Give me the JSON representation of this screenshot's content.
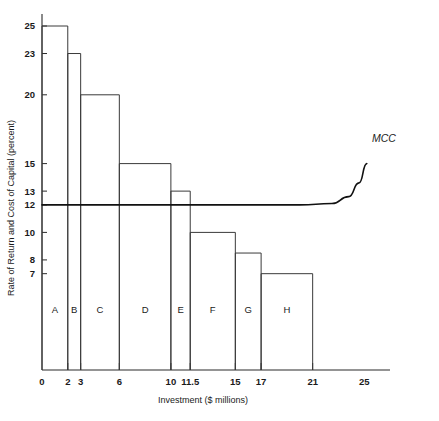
{
  "chart_data": {
    "type": "bar",
    "title": "",
    "subtitle": "",
    "xlabel": "Investment ($ millions)",
    "ylabel": "Rate of Return and Cost of Capital (percent)",
    "xlim": [
      0,
      27
    ],
    "ylim": [
      0,
      26
    ],
    "grid": false,
    "legend_position": "none",
    "x_tick_labels": [
      "0",
      "2",
      "3",
      "6",
      "10",
      "11.5",
      "15",
      "17",
      "21",
      "25"
    ],
    "x_tick_values": [
      0,
      2,
      3,
      6,
      10,
      11.5,
      15,
      17,
      21,
      25
    ],
    "y_tick_labels": [
      "25",
      "23",
      "20",
      "15",
      "13",
      "12",
      "10",
      "8",
      "7"
    ],
    "y_tick_values": [
      25,
      23,
      20,
      15,
      13,
      12,
      10,
      8,
      7
    ],
    "categories": [
      "A",
      "B",
      "C",
      "D",
      "E",
      "F",
      "G",
      "H"
    ],
    "values": [
      25,
      23,
      20,
      15,
      13,
      10,
      8.5,
      7
    ],
    "bar_edges": [
      {
        "label": "A",
        "x_start": 0,
        "x_end": 2,
        "rate_of_return": 25
      },
      {
        "label": "B",
        "x_start": 2,
        "x_end": 3,
        "rate_of_return": 23
      },
      {
        "label": "C",
        "x_start": 3,
        "x_end": 6,
        "rate_of_return": 20
      },
      {
        "label": "D",
        "x_start": 6,
        "x_end": 10,
        "rate_of_return": 15
      },
      {
        "label": "E",
        "x_start": 10,
        "x_end": 11.5,
        "rate_of_return": 13
      },
      {
        "label": "F",
        "x_start": 11.5,
        "x_end": 15,
        "rate_of_return": 10
      },
      {
        "label": "G",
        "x_start": 15,
        "x_end": 17,
        "rate_of_return": 8.5
      },
      {
        "label": "H",
        "x_start": 17,
        "x_end": 21,
        "rate_of_return": 7
      }
    ],
    "series": [
      {
        "name": "MCC",
        "label": "MCC",
        "type": "line",
        "flat_level": 12,
        "points": [
          {
            "x": 0,
            "y": 12
          },
          {
            "x": 20,
            "y": 12
          },
          {
            "x": 22.5,
            "y": 12.1
          },
          {
            "x": 23.8,
            "y": 12.6
          },
          {
            "x": 24.6,
            "y": 13.6
          },
          {
            "x": 25.2,
            "y": 15.0
          }
        ]
      }
    ],
    "annotations": [
      {
        "text": "MCC",
        "x": 25.6,
        "y": 16.6,
        "style": "italic"
      }
    ]
  },
  "colors": {
    "background": "#ffffff",
    "axis": "#2a2a2a",
    "bar_stroke": "#3a3a3a",
    "mcc_line": "#111111",
    "text": "#1a1a1a"
  }
}
